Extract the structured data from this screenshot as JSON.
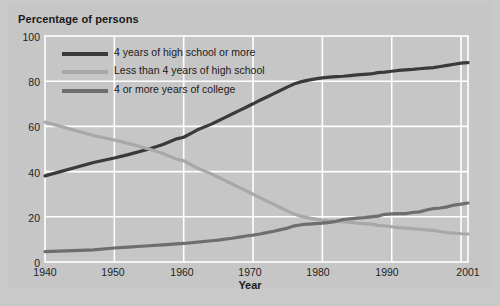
{
  "chart_data": {
    "type": "line",
    "title": "Percentage of persons",
    "xlabel": "Year",
    "ylabel": "Percentage of persons",
    "xlim": [
      1940,
      2001
    ],
    "ylim": [
      0,
      100
    ],
    "grid": true,
    "legend_position": "upper-left-inside",
    "xticks": [
      "1940",
      "1950",
      "1960",
      "1970",
      "1980",
      "1990",
      "2001"
    ],
    "xtick_values": [
      1940,
      1950,
      1960,
      1970,
      1980,
      1990,
      2001
    ],
    "yticks": [
      "0",
      "20",
      "40",
      "60",
      "80",
      "100"
    ],
    "ytick_values": [
      0,
      20,
      40,
      60,
      80,
      100
    ],
    "x": [
      1940,
      1947,
      1950,
      1952,
      1955,
      1957,
      1959,
      1960,
      1962,
      1964,
      1965,
      1966,
      1967,
      1968,
      1969,
      1970,
      1971,
      1972,
      1973,
      1974,
      1975,
      1976,
      1977,
      1978,
      1979,
      1980,
      1981,
      1982,
      1983,
      1984,
      1985,
      1986,
      1987,
      1988,
      1989,
      1990,
      1991,
      1992,
      1993,
      1994,
      1995,
      1996,
      1997,
      1998,
      1999,
      2000,
      2001
    ],
    "series": [
      {
        "name": "4 years of high school or more",
        "color": "#3a3a3a",
        "values": [
          38.1,
          44.0,
          46.0,
          47.5,
          50.0,
          52.0,
          54.5,
          55.2,
          58.5,
          61.0,
          62.5,
          64.0,
          65.5,
          67.0,
          68.5,
          70.0,
          71.6,
          73.0,
          74.5,
          76.0,
          77.5,
          78.9,
          79.8,
          80.5,
          81.0,
          81.5,
          81.8,
          82.0,
          82.2,
          82.5,
          82.8,
          83.0,
          83.2,
          83.8,
          84.0,
          84.4,
          84.8,
          85.0,
          85.2,
          85.5,
          85.8,
          86.0,
          86.5,
          87.0,
          87.5,
          88.0,
          88.2
        ]
      },
      {
        "name": "Less than 4 years of high school",
        "color": "#a8a8a8",
        "values": [
          61.9,
          56.0,
          54.0,
          52.5,
          50.0,
          48.0,
          45.5,
          44.8,
          41.5,
          39.0,
          37.5,
          36.0,
          34.5,
          33.0,
          31.5,
          30.0,
          28.4,
          27.0,
          25.5,
          24.0,
          22.5,
          21.1,
          20.2,
          19.5,
          19.0,
          18.5,
          18.2,
          18.0,
          17.8,
          17.5,
          17.2,
          17.0,
          16.8,
          16.2,
          16.0,
          15.6,
          15.2,
          15.0,
          14.8,
          14.5,
          14.2,
          14.0,
          13.5,
          13.0,
          12.8,
          12.5,
          12.4
        ]
      },
      {
        "name": "4 or more years of college",
        "color": "#6e6e6e",
        "values": [
          4.6,
          5.4,
          6.2,
          6.6,
          7.2,
          7.6,
          8.0,
          8.2,
          8.8,
          9.4,
          9.7,
          10.1,
          10.5,
          11.0,
          11.5,
          11.9,
          12.4,
          13.0,
          13.6,
          14.3,
          15.0,
          16.0,
          16.5,
          16.8,
          17.0,
          17.2,
          17.5,
          18.0,
          18.8,
          19.1,
          19.4,
          19.6,
          20.0,
          20.3,
          21.1,
          21.3,
          21.4,
          21.4,
          21.9,
          22.2,
          23.0,
          23.6,
          23.9,
          24.4,
          25.2,
          25.6,
          26.1
        ]
      }
    ]
  },
  "legend": {
    "entries": [
      {
        "label": "4 years of high school or more",
        "color": "#3a3a3a"
      },
      {
        "label": "Less than 4 years of high school",
        "color": "#a8a8a8"
      },
      {
        "label": "4 or more years of college",
        "color": "#6e6e6e"
      }
    ]
  },
  "axes": {
    "y_labels": [
      "100",
      "80",
      "60",
      "40",
      "20",
      "0"
    ],
    "x_labels": [
      "1940",
      "1950",
      "1960",
      "1970",
      "1980",
      "1990",
      "2001"
    ]
  },
  "colors": {
    "background": "#c6c6c6",
    "grid": "#ffffff",
    "text": "#1a1a1a"
  }
}
